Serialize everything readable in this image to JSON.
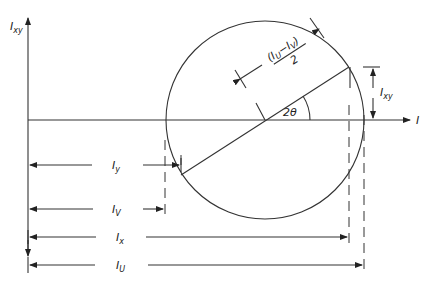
{
  "diagram": {
    "axes": {
      "vertical_label": {
        "main": "I",
        "sub": "xy"
      },
      "horizontal_label": {
        "main": "I",
        "sub": ""
      }
    },
    "radius_label": {
      "numerator": "(I",
      "sub_u": "U",
      "minus": "−I",
      "sub_v": "V",
      "close": ")",
      "denominator": "2"
    },
    "angle_label": "2θ",
    "ixy_label": {
      "main": "I",
      "sub": "xy"
    },
    "dimensions": [
      {
        "name": "Iy",
        "main": "I",
        "sub": "y"
      },
      {
        "name": "Iv",
        "main": "I",
        "sub": "V"
      },
      {
        "name": "Ix",
        "main": "I",
        "sub": "x"
      },
      {
        "name": "IU",
        "main": "I",
        "sub": "U"
      }
    ]
  }
}
